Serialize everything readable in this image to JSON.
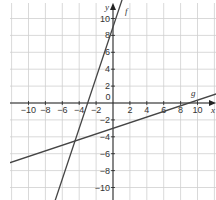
{
  "figure": {
    "corner_mark": "7"
  },
  "chart_data": {
    "type": "line",
    "title": "",
    "xlabel": "x",
    "ylabel": "y",
    "xlim": [
      -13,
      12
    ],
    "ylim": [
      -11.5,
      12
    ],
    "grid": true,
    "x_ticks": [
      -10,
      -8,
      -6,
      -4,
      -2,
      0,
      2,
      4,
      6,
      8,
      10
    ],
    "y_ticks": [
      10,
      8,
      6,
      4,
      2,
      -2,
      -4,
      -6,
      -8,
      -10
    ],
    "x_tick_labels": [
      "−10",
      "−8",
      "−6",
      "−4",
      "−2",
      "0",
      "2",
      "4",
      "6",
      "8",
      "10"
    ],
    "y_tick_labels": [
      "10",
      "8",
      "6",
      "4",
      "2",
      "−2",
      "−4",
      "−6",
      "−8",
      "−10"
    ],
    "series": [
      {
        "name": "f",
        "equation": "y = 3x + 9",
        "slope": 3,
        "intercept": 9,
        "points": [
          [
            -7,
            -12
          ],
          [
            -3,
            0
          ],
          [
            0,
            9
          ],
          [
            1,
            12
          ]
        ]
      },
      {
        "name": "g",
        "equation": "y = x/3 - 3",
        "slope": 0.3333,
        "intercept": -3,
        "points": [
          [
            -12,
            -7
          ],
          [
            0,
            -3
          ],
          [
            9,
            0
          ],
          [
            12,
            1
          ]
        ]
      }
    ],
    "intersection": [
      -4.5,
      -4.5
    ],
    "colors": {
      "grid": "#cfcfcf",
      "axes": "#222222",
      "lines": "#444444"
    }
  }
}
